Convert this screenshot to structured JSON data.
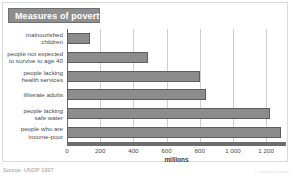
{
  "title": "Measures of poverty",
  "footer": {
    "source": "Source: UNDP 1997",
    "credit": "© cartographic design"
  },
  "axis": {
    "x_label": "millions",
    "ticks": [
      "0",
      "200",
      "400",
      "600",
      "800",
      "1 000",
      "1 200"
    ]
  },
  "colors": {
    "bar_fill": "#8c8c8c",
    "bar_edge": "#5e5e5e",
    "banner": "#8e8e8e",
    "banner_text": "#ffffff",
    "grid": "#cfcfcf",
    "axis": "#6d6d6d",
    "text": "#4a4a4a",
    "background": "#ffffff"
  },
  "chart_data": {
    "type": "bar",
    "orientation": "horizontal",
    "title": "Measures of poverty",
    "xlabel": "millions",
    "ylabel": "",
    "xlim": [
      0,
      1320
    ],
    "xticks": [
      0,
      200,
      400,
      600,
      800,
      1000,
      1200
    ],
    "xticklabels": [
      "0",
      "200",
      "400",
      "600",
      "800",
      "1 000",
      "1 200"
    ],
    "grid": true,
    "legend": false,
    "source": "Source: UNDP 1997",
    "categories": [
      "malnourished children",
      "people not expected to survive to age 40",
      "people lacking health services",
      "illiterate adults",
      "people lacking safe water",
      "people who are income-poor"
    ],
    "category_lines": [
      [
        "malnourished",
        "children"
      ],
      [
        "people not expected",
        "to survive to age 40"
      ],
      [
        "people lacking",
        "health services"
      ],
      [
        "illiterate adults"
      ],
      [
        "people lacking",
        "safe water"
      ],
      [
        "people who are",
        "income-poor"
      ]
    ],
    "values": [
      140,
      490,
      800,
      840,
      1225,
      1290
    ]
  }
}
